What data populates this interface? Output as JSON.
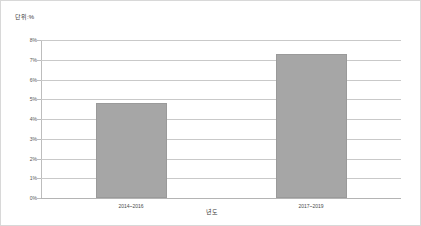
{
  "chart_data": {
    "type": "bar",
    "title": "",
    "subtitle": "",
    "unit_label": "단위:%",
    "xlabel": "년도",
    "ylabel": "",
    "categories": [
      "2014~2016",
      "2017~2019"
    ],
    "values": [
      4.8,
      7.3
    ],
    "series": [
      {
        "name": "비율",
        "values": [
          4.8,
          7.3
        ]
      }
    ],
    "ylim": [
      0,
      8
    ],
    "ytick_labels": [
      "8%",
      "7%",
      "6%",
      "5%",
      "4%",
      "3%",
      "2%",
      "1%",
      "0%"
    ],
    "ytick_values": [
      8,
      7,
      6,
      5,
      4,
      3,
      2,
      1,
      0
    ],
    "grid": true,
    "legend": false,
    "legend_position": "none",
    "bar_color": "#a6a6a6",
    "gridline_color": "#c9c9c9",
    "axis_color": "#bdbdbd"
  }
}
